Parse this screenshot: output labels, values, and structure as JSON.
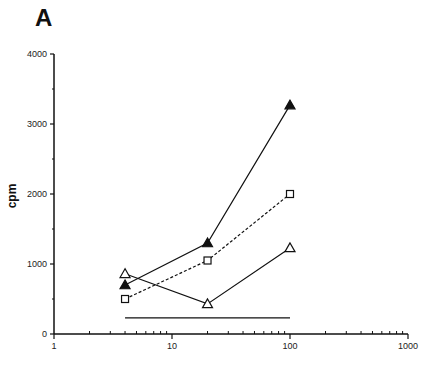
{
  "panel_label": "A",
  "chart_data": {
    "type": "line",
    "title": "",
    "xlabel": "",
    "ylabel": "cpm",
    "xscale": "log",
    "xlim": [
      1,
      1000
    ],
    "ylim": [
      0,
      4000
    ],
    "x_ticks": [
      1,
      10,
      100,
      1000
    ],
    "x_tick_labels": [
      "1",
      "10",
      "100",
      "1000"
    ],
    "y_ticks": [
      0,
      1000,
      2000,
      3000,
      4000
    ],
    "y_tick_labels": [
      "0",
      "1000",
      "2000",
      "3000",
      "4000"
    ],
    "y_minor_ticks": [
      500,
      1500,
      2500,
      3500
    ],
    "grid": false,
    "legend": null,
    "x": [
      4,
      20,
      100
    ],
    "series": [
      {
        "name": "filled-triangle",
        "marker": "filled-triangle",
        "line": "solid",
        "values": [
          700,
          1300,
          3270
        ]
      },
      {
        "name": "open-square",
        "marker": "open-square",
        "line": "dashed",
        "values": [
          500,
          1050,
          2000
        ]
      },
      {
        "name": "open-triangle",
        "marker": "open-triangle",
        "line": "solid",
        "values": [
          860,
          430,
          1230
        ]
      }
    ],
    "baseline": {
      "name": "background-level",
      "x_range": [
        4,
        100
      ],
      "value": 230,
      "line": "solid"
    },
    "colors": {
      "ink": "#111111"
    }
  }
}
